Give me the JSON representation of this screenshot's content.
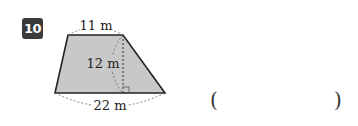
{
  "problem": {
    "number": "10",
    "figure": {
      "shape": "trapezoid",
      "top_label": "11 m",
      "height_label": "12 m",
      "bottom_label": "22 m",
      "fill_color": "#c8c8c8",
      "stroke_color": "#222222"
    },
    "answer": {
      "open_paren": "(",
      "close_paren": ")",
      "value": ""
    }
  }
}
